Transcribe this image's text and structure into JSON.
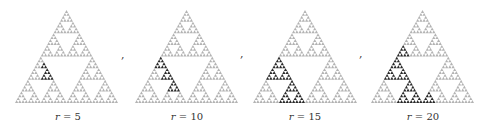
{
  "figure": {
    "fractal": "sierpinski-triangle",
    "depth": 5,
    "colors": {
      "base": "#b3b3b3",
      "hole": "#ffffff",
      "highlight": "#2a2a2a"
    },
    "separator": ",",
    "panels": [
      {
        "label_var": "r",
        "label_eq": " = ",
        "label_val": "5",
        "x0": 15,
        "x1": 118,
        "highlight": [
          "LTR",
          "LTTR"
        ]
      },
      {
        "label_var": "r",
        "label_eq": " = ",
        "label_val": "10",
        "x0": 135,
        "x1": 238,
        "highlight": [
          "LTT",
          "LTR",
          "LRT"
        ]
      },
      {
        "label_var": "r",
        "label_eq": " = ",
        "label_val": "15",
        "x0": 253,
        "x1": 357,
        "highlight": [
          "LT",
          "LR"
        ]
      },
      {
        "label_var": "r",
        "label_eq": " = ",
        "label_val": "20",
        "x0": 371,
        "x1": 474,
        "highlight": [
          "LT",
          "LR",
          "TLL",
          "RLL"
        ]
      }
    ],
    "apex_y": 10,
    "base_y": 103
  }
}
